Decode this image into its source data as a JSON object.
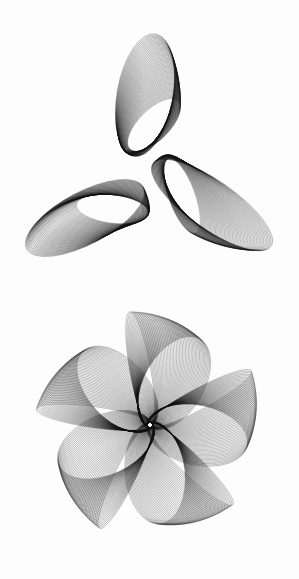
{
  "artwork": {
    "background": "#fdfdfd",
    "ink": "#111111",
    "figures": [
      {
        "name": "three-lobed-figure",
        "center": [
          150,
          175
        ],
        "lobes": [
          {
            "cx": 145,
            "cy": 95,
            "rx": 28,
            "ry": 62,
            "rot": 10,
            "family": 55,
            "shift": [
              18,
              60
            ],
            "shrink": 0.55
          },
          {
            "cx": 85,
            "cy": 218,
            "rx": 26,
            "ry": 66,
            "rot": 62,
            "family": 55,
            "shift": [
              55,
              -18
            ],
            "shrink": 0.55
          },
          {
            "cx": 212,
            "cy": 205,
            "rx": 24,
            "ry": 72,
            "rot": -55,
            "family": 55,
            "shift": [
              -60,
              -18
            ],
            "shrink": 0.55
          }
        ]
      },
      {
        "name": "five-petal-figure",
        "center": [
          150,
          425
        ],
        "petals": [
          {
            "angle": -100
          },
          {
            "angle": -28
          },
          {
            "angle": 44
          },
          {
            "angle": 116
          },
          {
            "angle": 188
          }
        ],
        "petal_length": 118,
        "petal_width": 30,
        "family": 45
      }
    ]
  }
}
